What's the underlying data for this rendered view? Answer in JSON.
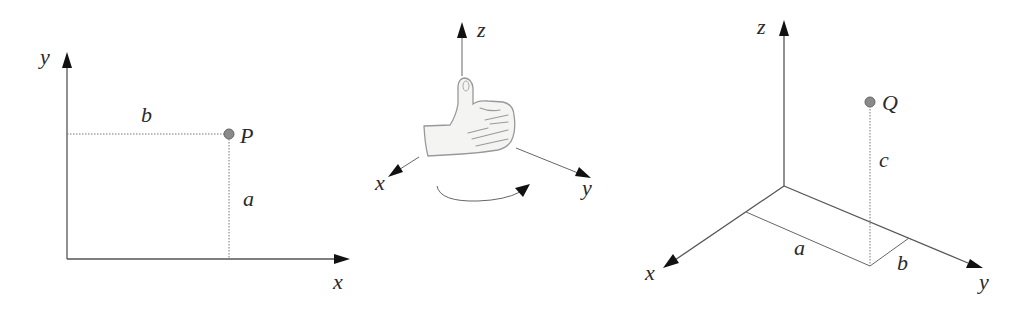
{
  "figure": {
    "left_panel": {
      "name": "2D coordinate system",
      "axis_labels": {
        "x": "x",
        "y": "y"
      },
      "point": {
        "label": "P"
      },
      "segment_labels": {
        "horizontal": "b",
        "vertical": "a"
      }
    },
    "middle_panel": {
      "name": "Right-hand rule",
      "axis_labels": {
        "x": "x",
        "y": "y",
        "z": "z"
      },
      "icon": "thumbs-up-hand",
      "rotation_arrow": "counterclockwise-rotation"
    },
    "right_panel": {
      "name": "3D coordinate system",
      "axis_labels": {
        "x": "x",
        "y": "y",
        "z": "z"
      },
      "point": {
        "label": "Q"
      },
      "segment_labels": {
        "along_y": "a",
        "along_x": "b",
        "height": "c"
      }
    }
  }
}
